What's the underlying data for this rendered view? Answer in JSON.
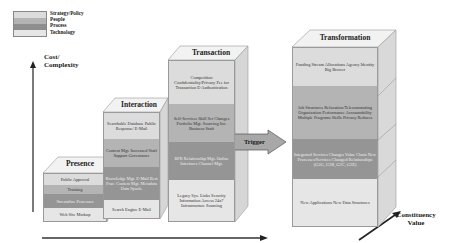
{
  "legend": {
    "items": [
      {
        "label": "Strategy/Policy",
        "color": "#dcdcdc"
      },
      {
        "label": "People",
        "color": "#b4b4b4"
      },
      {
        "label": "Process",
        "color": "#959595"
      },
      {
        "label": "Technology",
        "color": "#e6e6e6"
      }
    ]
  },
  "axes": {
    "y_label_line1": "Cost/",
    "y_label_line2": "Complexity",
    "z_label_line1": "Constituency",
    "z_label_line2": "Value"
  },
  "trigger": {
    "label": "Trigger"
  },
  "stages": [
    {
      "title": "Presence",
      "segments": [
        {
          "layer": "strategy",
          "text": "Public Approval"
        },
        {
          "layer": "people",
          "text": "Training"
        },
        {
          "layer": "process",
          "text": "Streamline Processes"
        },
        {
          "layer": "tech",
          "text": "Web Site Markup"
        }
      ]
    },
    {
      "title": "Interaction",
      "segments": [
        {
          "layer": "strategy",
          "text": "Searchable Database Public Response/ E-Mail"
        },
        {
          "layer": "people",
          "text": "Content Mgt. Increased Staff Support Governance"
        },
        {
          "layer": "process",
          "text": "Knowledge Mgt. E-Mail Best Prac. Content Mgt. Metadata Data Synch."
        },
        {
          "layer": "tech",
          "text": "Search Engine E-Mail"
        }
      ]
    },
    {
      "title": "Transaction",
      "segments": [
        {
          "layer": "strategy",
          "text": "Competition Confidentiality/Privacy Fee for Transaction E-Authentication"
        },
        {
          "layer": "people",
          "text": "Self-Services Skill Set Changes Portfolio Mgt. Sourcing Inc. Business Staff"
        },
        {
          "layer": "process",
          "text": "BPR Relationship Mgt. Online Interfaces Channel Mgt."
        },
        {
          "layer": "tech",
          "text": "Legacy Sys. Links Security Information Access 24x7 Infrastructure Sourcing"
        }
      ]
    },
    {
      "title": "Transformation",
      "segments": [
        {
          "layer": "strategy",
          "text": "Funding Stream Allocations Agency Identity Big Brower"
        },
        {
          "layer": "people",
          "text": "Job Structures Relocation/Telecommuting Organization Performance Accountability Multiple Programs Skills Privacy Reduces"
        },
        {
          "layer": "process",
          "text": "Integrated Services Changes Value Chain New Processes/Services Changed Relationships (G2G, G2B, G2C, G2E)"
        },
        {
          "layer": "tech",
          "text": "New Applications New Data Structures"
        }
      ]
    }
  ]
}
